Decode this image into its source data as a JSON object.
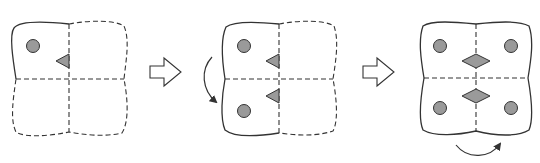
{
  "figure": {
    "colors": {
      "stroke": "#333333",
      "fill": "#9a9a9a",
      "background": "#ffffff"
    },
    "top_text_clipped": "",
    "panels": [
      {
        "id": "step-1",
        "solid_quadrants": [
          "top-left"
        ],
        "dashed_quadrants": [
          "top-right",
          "bottom-left",
          "bottom-right"
        ],
        "circles": 1,
        "triangles": 1,
        "diamonds": 0,
        "rotation_arrow": "none"
      },
      {
        "id": "step-2",
        "solid_quadrants": [
          "top-left",
          "bottom-left"
        ],
        "dashed_quadrants": [
          "top-right",
          "bottom-right"
        ],
        "circles": 2,
        "triangles": 2,
        "diamonds": 0,
        "rotation_arrow": "left-side, top-to-bottom"
      },
      {
        "id": "step-3",
        "solid_quadrants": [
          "top-left",
          "top-right",
          "bottom-left",
          "bottom-right"
        ],
        "dashed_quadrants": [],
        "circles": 4,
        "triangles": 0,
        "diamonds": 2,
        "rotation_arrow": "bottom, left-to-right"
      }
    ],
    "transition_arrows": [
      {
        "from": "step-1",
        "to": "step-2",
        "icon": "hollow-right-arrow"
      },
      {
        "from": "step-2",
        "to": "step-3",
        "icon": "hollow-right-arrow"
      }
    ]
  }
}
